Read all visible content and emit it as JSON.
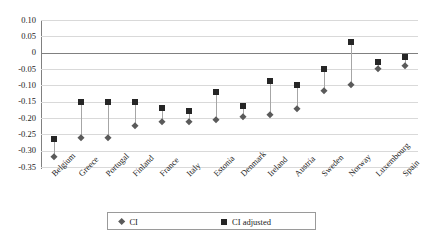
{
  "chart_data": {
    "type": "scatter",
    "title": "",
    "subtitle": "",
    "xlabel": "",
    "ylabel": "",
    "ylim": [
      -0.35,
      0.1
    ],
    "grid": true,
    "legend_position": "bottom",
    "yticks": [
      "0.10",
      "0.05",
      "0",
      "-0.05",
      "-0.10",
      "-0.15",
      "-0.20",
      "-0.25",
      "-0.30",
      "-0.35"
    ],
    "ytick_values": [
      0.1,
      0.05,
      0,
      -0.05,
      -0.1,
      -0.15,
      -0.2,
      -0.25,
      -0.3,
      -0.35
    ],
    "categories": [
      "Belgium",
      "Greece",
      "Portugal",
      "Finland",
      "France",
      "Italy",
      "Estonia",
      "Denmark",
      "Ireland",
      "Austria",
      "Sweden",
      "Norway",
      "Luxembourg",
      "Spain"
    ],
    "series": [
      {
        "name": "CI",
        "marker": "diamond",
        "color": "#5a5a5a",
        "values": [
          -0.32,
          -0.262,
          -0.262,
          -0.224,
          -0.212,
          -0.212,
          -0.205,
          -0.198,
          -0.19,
          -0.173,
          -0.118,
          -0.098,
          -0.05,
          -0.042
        ]
      },
      {
        "name": "CI adjusted",
        "marker": "square",
        "color": "#262626",
        "values": [
          -0.263,
          -0.151,
          -0.151,
          -0.151,
          -0.17,
          -0.178,
          -0.12,
          -0.163,
          -0.086,
          -0.098,
          -0.05,
          0.034,
          -0.029,
          -0.013
        ]
      }
    ],
    "connectors": true,
    "zero_line": true
  },
  "legend": {
    "items": [
      {
        "label": "CI",
        "marker": "diamond-marker"
      },
      {
        "label": "CI adjusted",
        "marker": "square-marker"
      }
    ]
  }
}
